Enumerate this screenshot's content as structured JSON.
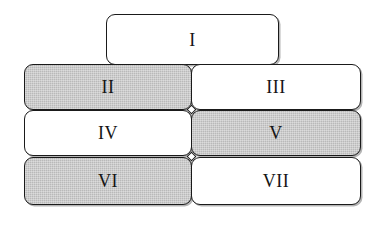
{
  "diagram": {
    "type": "block-hierarchy",
    "background_color": "#ffffff",
    "outline_color": "#1a1a1a",
    "shaded_fill_color": "#b9b9b9",
    "plain_fill_color": "#ffffff",
    "nodes": [
      {
        "id": "node-1",
        "label": "I",
        "shaded": false,
        "row": 1,
        "column": "center",
        "x": 106,
        "y": 14,
        "width": 173,
        "height": 51
      },
      {
        "id": "node-2",
        "label": "II",
        "shaded": true,
        "row": 2,
        "column": "left",
        "x": 24,
        "y": 64,
        "width": 168,
        "height": 46
      },
      {
        "id": "node-3",
        "label": "III",
        "shaded": false,
        "row": 2,
        "column": "right",
        "x": 191,
        "y": 64,
        "width": 170,
        "height": 46
      },
      {
        "id": "node-4",
        "label": "IV",
        "shaded": false,
        "row": 3,
        "column": "left",
        "x": 24,
        "y": 110,
        "width": 168,
        "height": 46
      },
      {
        "id": "node-5",
        "label": "V",
        "shaded": true,
        "row": 3,
        "column": "right",
        "x": 191,
        "y": 110,
        "width": 170,
        "height": 46
      },
      {
        "id": "node-6",
        "label": "VI",
        "shaded": true,
        "row": 4,
        "column": "left",
        "x": 24,
        "y": 157,
        "width": 168,
        "height": 48
      },
      {
        "id": "node-7",
        "label": "VII",
        "shaded": false,
        "row": 4,
        "column": "right",
        "x": 191,
        "y": 157,
        "width": 170,
        "height": 48
      }
    ],
    "junctions": [
      {
        "id": "junction-upper",
        "x": 188,
        "y": 106
      },
      {
        "id": "junction-lower",
        "x": 188,
        "y": 153
      }
    ]
  }
}
